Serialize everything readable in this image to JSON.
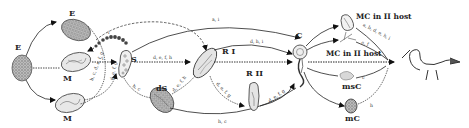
{
  "figure": {
    "type": "life-cycle-diagram",
    "stages": {
      "E_left": "E",
      "E_top": "E",
      "M_mid": "M",
      "M_bottom": "M",
      "S": "S",
      "dS": "dS",
      "RI": "R I",
      "RII": "R II",
      "C": "C",
      "mc_host_top": "MC in II host",
      "mc_host_mid": "MC in II host",
      "msC": "msC",
      "mC": "mC"
    },
    "edge_labels": {
      "m_top_to_s": "i",
      "m_mid_to_s": "i",
      "m_bottom_to_s": "b, c, d, e, f, g",
      "m_mid_vertical": "d, e, f, g",
      "s_to_c": "a, i",
      "s_to_ri": "d, e, f, h",
      "s_to_ds": "h, c",
      "ds_to_ri": "d, e, f, h",
      "ri_to_c": "d, h, i",
      "ri_to_c_dashed": "h, c",
      "ri_to_rii": "d, e, f, g",
      "rii_to_c": "d, e, f, g",
      "ds_to_c": "h, c",
      "c_to_mc_top": "a, b, d, e, h, i",
      "c_to_mc_mid": "e, f",
      "c_to_msc": "c",
      "c_to_mc": "h"
    },
    "final_host": "bird-icon"
  }
}
